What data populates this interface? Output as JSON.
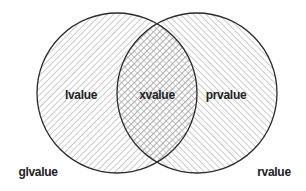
{
  "diagram": {
    "type": "venn",
    "sets": [
      {
        "id": "left",
        "hatch": "forward-diagonal"
      },
      {
        "id": "right",
        "hatch": "backward-diagonal"
      }
    ],
    "intersection_hatch": "crosshatch",
    "colors": {
      "stroke": "#2a2a2a",
      "hatch": "#9a9a9a",
      "text": "#222222",
      "background": "#ffffff"
    }
  },
  "labels": {
    "left_only": "lvalue",
    "intersection": "xvalue",
    "right_only": "prvalue",
    "outer_left": "glvalue",
    "outer_right": "rvalue"
  }
}
